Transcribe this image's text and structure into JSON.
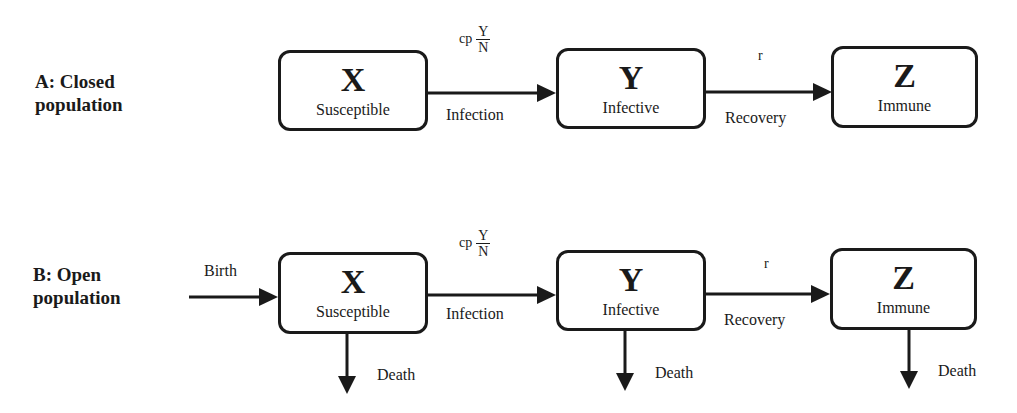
{
  "diagram": {
    "type": "compartmental-epidemic-model",
    "panels": [
      {
        "label_line1": "A: Closed",
        "label_line2": "population",
        "compartments": [
          {
            "symbol": "X",
            "name": "Susceptible"
          },
          {
            "symbol": "Y",
            "name": "Infective"
          },
          {
            "symbol": "Z",
            "name": "Immune"
          }
        ],
        "transitions": [
          {
            "from": "X",
            "to": "Y",
            "label": "Infection",
            "rate_prefix": "cp",
            "rate_num": "Y",
            "rate_den": "N"
          },
          {
            "from": "Y",
            "to": "Z",
            "label": "Recovery",
            "rate": "r"
          }
        ]
      },
      {
        "label_line1": "B: Open",
        "label_line2": "population",
        "inflow_label": "Birth",
        "compartments": [
          {
            "symbol": "X",
            "name": "Susceptible",
            "outflow": "Death"
          },
          {
            "symbol": "Y",
            "name": "Infective",
            "outflow": "Death"
          },
          {
            "symbol": "Z",
            "name": "Immune",
            "outflow": "Death"
          }
        ],
        "transitions": [
          {
            "from": "X",
            "to": "Y",
            "label": "Infection",
            "rate_prefix": "cp",
            "rate_num": "Y",
            "rate_den": "N"
          },
          {
            "from": "Y",
            "to": "Z",
            "label": "Recovery",
            "rate": "r"
          }
        ]
      }
    ]
  }
}
